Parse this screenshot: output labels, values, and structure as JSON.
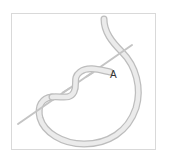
{
  "diagram": {
    "type": "knot-illustration",
    "elements": [
      "thread",
      "needle",
      "label"
    ],
    "label": "A",
    "colors": {
      "frame_border": "#d9d9d9",
      "thread_fill": "#e6e6e6",
      "thread_edge": "#bdbdbd",
      "needle": "#c4c4c4",
      "label": "#333333"
    }
  }
}
